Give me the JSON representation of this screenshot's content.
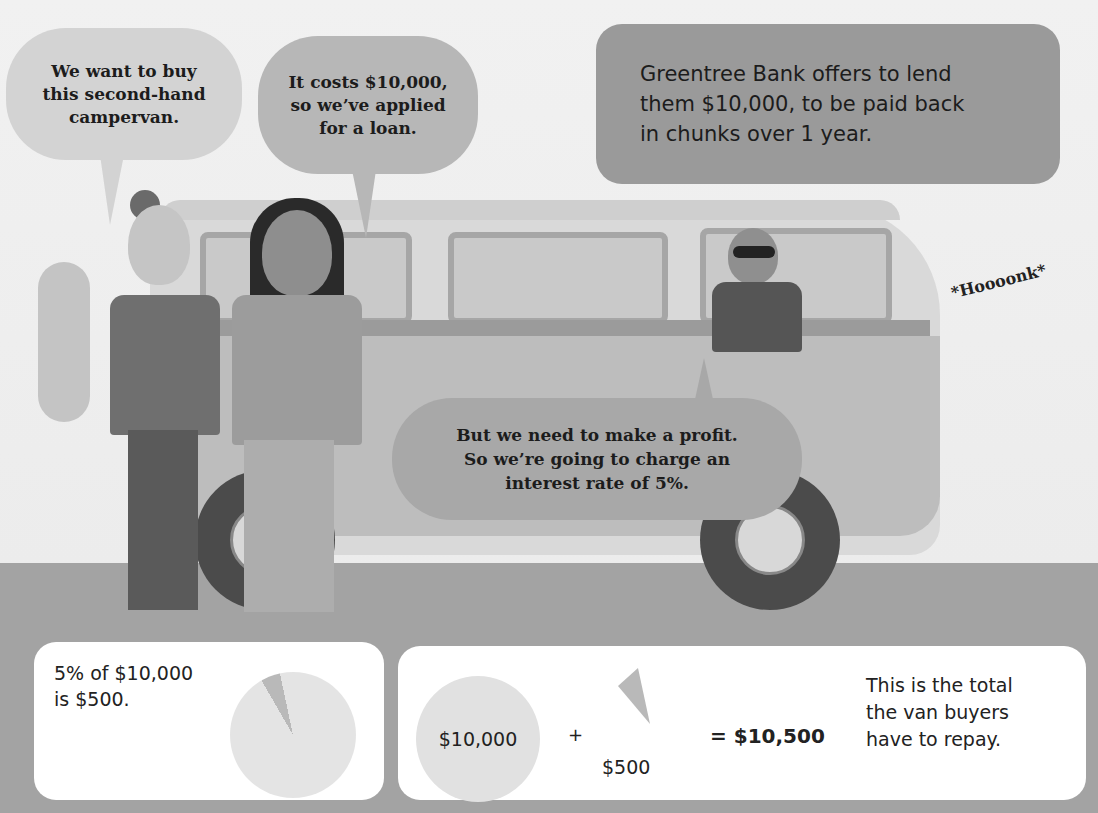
{
  "scene": {
    "colors": {
      "sky": "#efefef",
      "road": "#a3a3a3",
      "bubble_light": "#d3d3d3",
      "bubble_mid": "#b7b7b7",
      "bubble_dark": "#9a9a9a",
      "card": "#ffffff"
    }
  },
  "bubbles": {
    "buyer1": "We want to buy\nthis second-hand\ncampervan.",
    "buyer2": "It costs $10,000,\nso we’ve applied\nfor a loan.",
    "narration": "Greentree Bank offers to lend\nthem $10,000, to be paid back\nin chunks over 1 year.",
    "banker": "But we need to make a profit.\nSo we’re going to charge an\ninterest rate of 5%."
  },
  "sound_effect": "*Hoooonk*",
  "cards": {
    "interest": {
      "text": "5% of $10,000\nis $500.",
      "pie_icon": "pie-chart-5-percent"
    },
    "total": {
      "principal": "$10,000",
      "plus": "+",
      "interest": "$500",
      "equals": "= $10,500",
      "caption": "This is the total\nthe van buyers\nhave to repay."
    }
  }
}
